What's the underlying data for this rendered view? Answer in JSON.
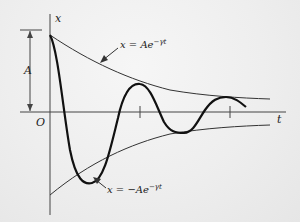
{
  "diagram": {
    "type": "damped-oscillation",
    "axes": {
      "vertical_label": "x",
      "horizontal_label": "t",
      "origin_label": "O"
    },
    "amplitude_label": "A",
    "upper_envelope_label": "x = Ae",
    "upper_envelope_exponent": "−γt",
    "lower_envelope_label": "x = −Ae",
    "lower_envelope_exponent": "−γt",
    "colors": {
      "curve": "#111111",
      "envelope": "#333333",
      "axis": "#444444",
      "background": "#eeeeee"
    }
  }
}
